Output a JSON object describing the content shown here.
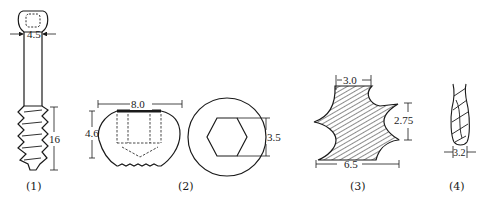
{
  "figures": [
    {
      "id": "1",
      "caption": "(1)",
      "subject": "screw",
      "dimensions": {
        "shaft_diameter": "4.5",
        "thread_length": "16"
      }
    },
    {
      "id": "2",
      "caption": "(2)",
      "subject": "screw-head side and top view with hex socket",
      "dimensions": {
        "head_width": "8.0",
        "head_height": "4.6",
        "hex_size": "3.5"
      }
    },
    {
      "id": "3",
      "caption": "(3)",
      "subject": "thread profile cross-section",
      "dimensions": {
        "top_width": "3.0",
        "pitch": "2.75",
        "outer_width": "6.5"
      }
    },
    {
      "id": "4",
      "caption": "(4)",
      "subject": "drill bit",
      "dimensions": {
        "diameter": "3.2"
      }
    }
  ],
  "colors": {
    "line": "#1a1a1a",
    "background": "#ffffff"
  }
}
